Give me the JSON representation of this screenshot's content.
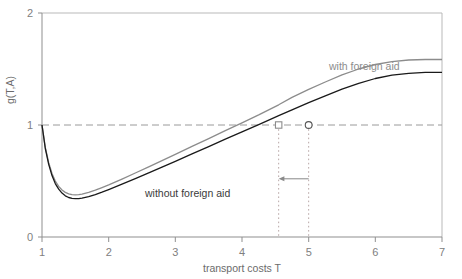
{
  "chart_data": {
    "type": "line",
    "title": "",
    "xlabel": "transport costs T",
    "ylabel": "g(T,A)",
    "xlim": [
      1,
      7
    ],
    "ylim": [
      0,
      2
    ],
    "xticks": [
      1,
      2,
      3,
      4,
      5,
      6,
      7
    ],
    "yticks": [
      0,
      1,
      2
    ],
    "xtick_labels": [
      "1",
      "2",
      "3",
      "4",
      "5",
      "6",
      "7"
    ],
    "ytick_labels": [
      "0",
      "1",
      "2"
    ],
    "grid": false,
    "legend_position": "inline-annotations",
    "series": [
      {
        "name": "with foreign aid",
        "color": "#8c8c8c",
        "label_text": "with foreign aid",
        "x": [
          1.0,
          1.05,
          1.1,
          1.15,
          1.2,
          1.25,
          1.3,
          1.35,
          1.4,
          1.45,
          1.5,
          1.55,
          1.6,
          1.7,
          1.8,
          1.9,
          2.0,
          2.2,
          2.4,
          2.6,
          2.8,
          3.0,
          3.25,
          3.5,
          3.75,
          4.0,
          4.25,
          4.55,
          4.75,
          5.0,
          5.25,
          5.5,
          5.75,
          6.0,
          6.25,
          6.5,
          6.75,
          7.0
        ],
        "values": [
          1.0,
          0.8,
          0.663,
          0.567,
          0.5,
          0.452,
          0.42,
          0.398,
          0.385,
          0.378,
          0.376,
          0.378,
          0.383,
          0.398,
          0.418,
          0.441,
          0.465,
          0.517,
          0.571,
          0.626,
          0.682,
          0.738,
          0.809,
          0.879,
          0.95,
          1.02,
          1.09,
          1.18,
          1.246,
          1.318,
          1.384,
          1.448,
          1.5,
          1.54,
          1.566,
          1.58,
          1.585,
          1.585
        ]
      },
      {
        "name": "without foreign aid",
        "color": "#1a1a1a",
        "label_text": "without foreign aid",
        "x": [
          1.0,
          1.05,
          1.1,
          1.15,
          1.2,
          1.25,
          1.3,
          1.35,
          1.4,
          1.45,
          1.5,
          1.55,
          1.6,
          1.7,
          1.8,
          1.9,
          2.0,
          2.2,
          2.4,
          2.6,
          2.8,
          3.0,
          3.25,
          3.5,
          3.75,
          4.0,
          4.25,
          4.55,
          4.75,
          5.0,
          5.25,
          5.5,
          5.75,
          6.0,
          6.25,
          6.5,
          6.75,
          7.0
        ],
        "values": [
          1.0,
          0.79,
          0.648,
          0.548,
          0.477,
          0.427,
          0.392,
          0.368,
          0.353,
          0.345,
          0.342,
          0.343,
          0.347,
          0.36,
          0.379,
          0.4,
          0.423,
          0.471,
          0.521,
          0.572,
          0.624,
          0.676,
          0.742,
          0.807,
          0.873,
          0.939,
          1.004,
          1.083,
          1.136,
          1.2,
          1.261,
          1.32,
          1.372,
          1.415,
          1.445,
          1.462,
          1.47,
          1.47
        ]
      }
    ],
    "reference_lines": [
      {
        "name": "unity-level",
        "orientation": "horizontal",
        "value": 1,
        "style": "dashed",
        "color": "#9a9a9a"
      },
      {
        "name": "threshold-with-aid",
        "orientation": "vertical",
        "value": 4.55,
        "style": "dotted",
        "color": "#b0a0a0"
      },
      {
        "name": "threshold-without-aid",
        "orientation": "vertical",
        "value": 5.0,
        "style": "dotted",
        "color": "#b0a0a0"
      }
    ],
    "markers": [
      {
        "name": "intersection-with-aid",
        "shape": "square",
        "x": 4.55,
        "y": 1.0,
        "color": "#8c8c8c"
      },
      {
        "name": "intersection-without-aid",
        "shape": "circle",
        "x": 5.0,
        "y": 1.0,
        "color": "#555555"
      }
    ],
    "annotations": [
      {
        "name": "shift-arrow",
        "type": "arrow",
        "from_x": 5.0,
        "to_x": 4.55,
        "y": 0.52,
        "direction": "left",
        "color": "#8c8c8c"
      }
    ]
  },
  "labels": {
    "with_aid": "with foreign aid",
    "without_aid": "without foreign aid",
    "xaxis": "transport costs T",
    "yaxis": "g(T,A)",
    "y0": "0",
    "y1": "1",
    "y2": "2",
    "x1": "1",
    "x2": "2",
    "x3": "3",
    "x4": "4",
    "x5": "5",
    "x6": "6",
    "x7": "7"
  }
}
